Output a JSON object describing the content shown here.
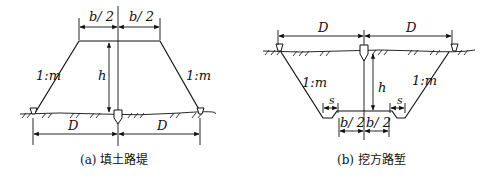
{
  "figure_a": {
    "caption": "(a) 填土路堤",
    "top_half_width_left": "b/ 2",
    "top_half_width_right": "b/ 2",
    "height_label": "h",
    "slope_left": "1:m",
    "slope_right": "1:m",
    "offset_left": "D",
    "offset_right": "D"
  },
  "figure_b": {
    "caption": "(b) 挖方路堑",
    "offset_left": "D",
    "offset_right": "D",
    "height_label": "h",
    "slope_left": "1:m",
    "slope_right": "1:m",
    "ditch_left": "s",
    "ditch_right": "s",
    "bottom_half_width_left": "b/ 2",
    "bottom_half_width_right": "b/ 2"
  },
  "colors": {
    "line": "#111111",
    "background": "#ffffff"
  }
}
